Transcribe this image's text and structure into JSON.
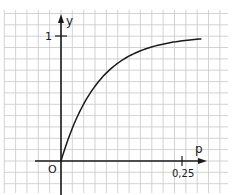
{
  "chart_data": {
    "type": "line",
    "title": "",
    "xlabel": "p",
    "ylabel": "y",
    "origin_label": "O",
    "x_ticks": [
      {
        "value": 0.25,
        "label": "0,25"
      }
    ],
    "y_ticks": [
      {
        "value": 1,
        "label": "1"
      }
    ],
    "xlim": [
      -0.055,
      0.34
    ],
    "ylim": [
      -0.23,
      1.17
    ],
    "grid": true,
    "legend": null,
    "series": [
      {
        "name": "y(p)",
        "formula": "y = 1 - exp(-13 p)",
        "x": [
          0,
          0.02,
          0.04,
          0.06,
          0.08,
          0.1,
          0.12,
          0.14,
          0.16,
          0.18,
          0.2,
          0.22,
          0.24,
          0.26,
          0.28,
          0.29
        ],
        "values": [
          0,
          0.23,
          0.41,
          0.54,
          0.65,
          0.73,
          0.79,
          0.84,
          0.88,
          0.9,
          0.93,
          0.94,
          0.96,
          0.97,
          0.97,
          0.98
        ]
      }
    ]
  },
  "style": {
    "grid_color": "#c8c8c8",
    "axis_color": "#1a1a1a",
    "curve_color": "#1a1a1a"
  }
}
